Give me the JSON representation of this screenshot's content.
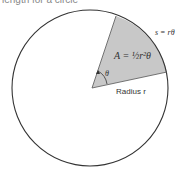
{
  "caption": "length for a circle",
  "diagram": {
    "area_label": "A = ½r²θ",
    "arc_label": "s = rθ",
    "angle_label": "θ",
    "radius_label": "Radius r",
    "colors": {
      "sector_fill": "#c8c8c8",
      "outline": "#333333"
    }
  }
}
